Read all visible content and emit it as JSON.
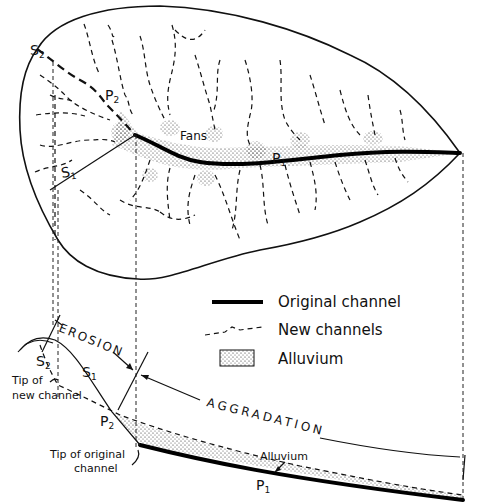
{
  "plan_view": {
    "labels": {
      "s2": "S",
      "s2_sub": "2",
      "p2": "P",
      "p2_sub": "2",
      "s1": "S",
      "s1_sub": "1",
      "fans": "Fans",
      "p1": "P",
      "p1_sub": "1"
    }
  },
  "legend": {
    "items": [
      {
        "symbol": "solid-thick-line",
        "label": "Original channel"
      },
      {
        "symbol": "dashed-line",
        "label": "New channels"
      },
      {
        "symbol": "stippled-box",
        "label": "Alluvium"
      }
    ]
  },
  "profile_view": {
    "labels": {
      "erosion": "EROSION",
      "aggradation": "AGGRADATION",
      "s2": "S",
      "s2_sub": "2",
      "s1": "S",
      "s1_sub": "1",
      "p2": "P",
      "p2_sub": "2",
      "p1": "P",
      "p1_sub": "1",
      "tip_new_line1": "Tip of",
      "tip_new_line2": "new channel",
      "tip_orig_line1": "Tip of original",
      "tip_orig_line2": "channel",
      "alluvium": "Alluvium"
    }
  }
}
